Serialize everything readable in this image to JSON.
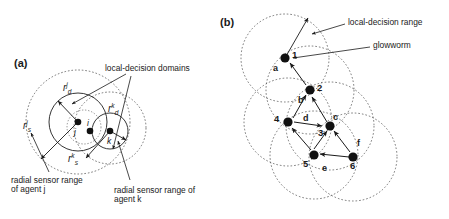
{
  "figure": {
    "panel_a": {
      "label": "(a)",
      "annotations": {
        "local_decision_domains": "local-decision domains",
        "sensor_range_j": "radial sensor range\nof agent j",
        "sensor_range_k": "radial sensor range of\nagent k"
      },
      "symbols": [
        {
          "name": "decision-radius-j",
          "base": "r",
          "sup": "j",
          "sub": "d"
        },
        {
          "name": "decision-radius-k",
          "base": "r",
          "sup": "k",
          "sub": "d"
        },
        {
          "name": "sensor-radius-j",
          "base": "r",
          "sup": "j",
          "sub": "s"
        },
        {
          "name": "sensor-radius-k",
          "base": "r",
          "sup": "k",
          "sub": "s"
        }
      ],
      "agents": [
        {
          "id": "j",
          "label": "j"
        },
        {
          "id": "i",
          "label": "i"
        },
        {
          "id": "k",
          "label": "k"
        }
      ]
    },
    "panel_b": {
      "label": "(b)",
      "annotations": {
        "local_decision_range": "local-decision range",
        "glowworm": "glowworm"
      },
      "nodes": [
        {
          "id": 1,
          "label": "1"
        },
        {
          "id": 2,
          "label": "2"
        },
        {
          "id": 3,
          "label": "3"
        },
        {
          "id": 4,
          "label": "4"
        },
        {
          "id": 5,
          "label": "5"
        },
        {
          "id": 6,
          "label": "6"
        }
      ],
      "edges": [
        {
          "id": "a",
          "label": "a"
        },
        {
          "id": "b",
          "label": "b"
        },
        {
          "id": "c",
          "label": "c"
        },
        {
          "id": "d",
          "label": "d"
        },
        {
          "id": "e",
          "label": "e"
        },
        {
          "id": "f",
          "label": "f"
        }
      ]
    }
  },
  "colors": {
    "ink": "#1a1a1a",
    "solid_stroke": "#2b2b2b",
    "dashed_stroke": "#555555",
    "node_fill": "#111111",
    "background": "#ffffff"
  }
}
